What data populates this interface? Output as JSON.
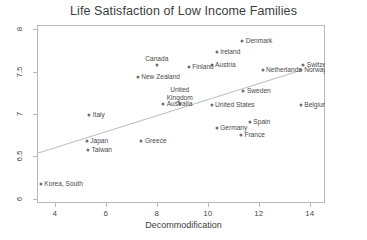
{
  "chart_data": {
    "type": "scatter",
    "title": "Life Satisfaction of Low Income Families",
    "xlabel": "Decommodification",
    "ylabel": "",
    "xlim": [
      3.3,
      14.6
    ],
    "ylim": [
      5.95,
      8.05
    ],
    "xticks": [
      4,
      6,
      8,
      10,
      12,
      14
    ],
    "xtick_labels": [
      "4",
      "6",
      "8",
      "10",
      "12",
      "14"
    ],
    "yticks": [
      6,
      6.5,
      7,
      7.5,
      8
    ],
    "ytick_labels": [
      "6",
      "6.5",
      "7",
      "7.5",
      "8"
    ],
    "grid": false,
    "legend": "none",
    "marker_color": "#707070",
    "line_color": "#c0c0c0",
    "frame_color": "#b8b8b8",
    "points": [
      {
        "label": "Denmark",
        "x": 11.35,
        "y": 7.86,
        "pos": "right"
      },
      {
        "label": "Ireland",
        "x": 10.35,
        "y": 7.73,
        "pos": "right"
      },
      {
        "label": "Canada",
        "x": 8.0,
        "y": 7.58,
        "pos": "above"
      },
      {
        "label": "Switzerland",
        "x": 13.75,
        "y": 7.58,
        "pos": "right"
      },
      {
        "label": "Austria",
        "x": 10.15,
        "y": 7.58,
        "pos": "right"
      },
      {
        "label": "Finland",
        "x": 9.25,
        "y": 7.55,
        "pos": "right"
      },
      {
        "label": "Netherlands",
        "x": 12.15,
        "y": 7.52,
        "pos": "right"
      },
      {
        "label": "Norway",
        "x": 13.65,
        "y": 7.52,
        "pos": "right"
      },
      {
        "label": "New Zealand",
        "x": 7.25,
        "y": 7.44,
        "pos": "right"
      },
      {
        "label": "Sweden",
        "x": 11.4,
        "y": 7.27,
        "pos": "right"
      },
      {
        "label": "United\nKingdom",
        "x": 8.9,
        "y": 7.12,
        "pos": "above"
      },
      {
        "label": "Australia",
        "x": 8.25,
        "y": 7.12,
        "pos": "right"
      },
      {
        "label": "United States",
        "x": 10.15,
        "y": 7.11,
        "pos": "right"
      },
      {
        "label": "Belgium",
        "x": 13.65,
        "y": 7.11,
        "pos": "right"
      },
      {
        "label": "Italy",
        "x": 5.35,
        "y": 6.99,
        "pos": "right"
      },
      {
        "label": "Spain",
        "x": 11.65,
        "y": 6.91,
        "pos": "right"
      },
      {
        "label": "Germany",
        "x": 10.35,
        "y": 6.83,
        "pos": "right"
      },
      {
        "label": "France",
        "x": 11.3,
        "y": 6.75,
        "pos": "right"
      },
      {
        "label": "Greece",
        "x": 7.4,
        "y": 6.68,
        "pos": "right"
      },
      {
        "label": "Japan",
        "x": 5.25,
        "y": 6.68,
        "pos": "right"
      },
      {
        "label": "Taiwan",
        "x": 5.3,
        "y": 6.58,
        "pos": "right"
      },
      {
        "label": "Korea, South",
        "x": 3.45,
        "y": 6.17,
        "pos": "right"
      }
    ],
    "trend_line": {
      "x1": 3.35,
      "y1": 6.54,
      "x2": 13.7,
      "y2": 7.52
    }
  }
}
